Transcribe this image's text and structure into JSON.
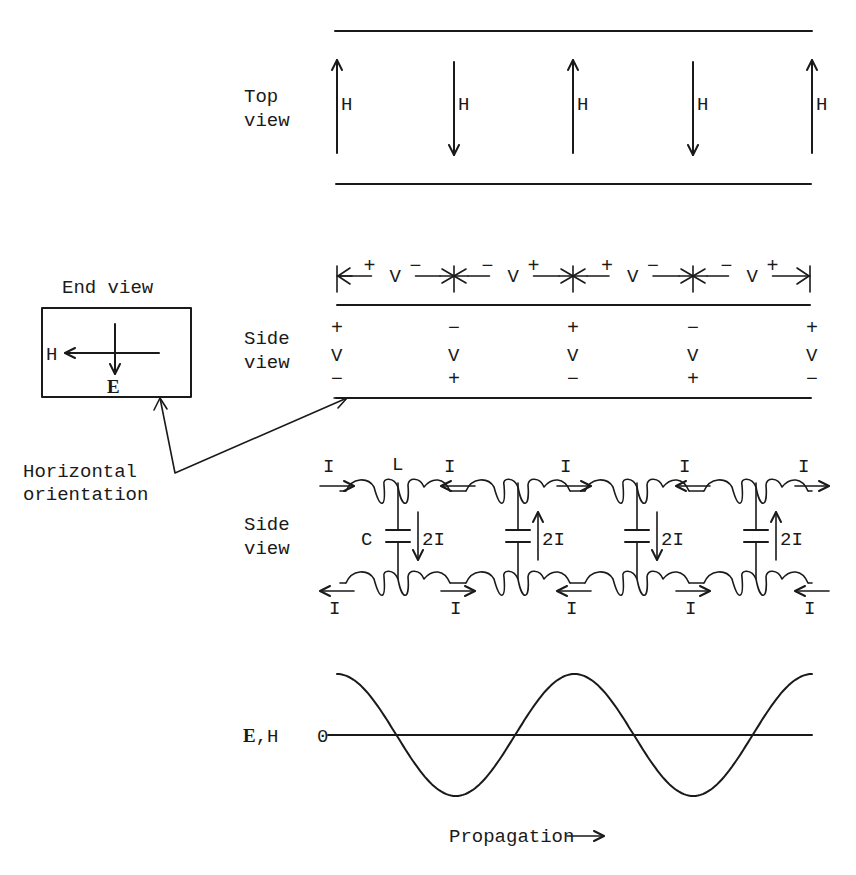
{
  "top_view": {
    "label_line1": "Top",
    "label_line2": "view",
    "field_label": "H",
    "arrows": [
      "up",
      "down",
      "up",
      "down",
      "up"
    ]
  },
  "end_view": {
    "title": "End view",
    "h_label": "H",
    "e_label": "E"
  },
  "side_view_voltage": {
    "label_line1": "Side",
    "label_line2": "view",
    "dimension_label": "V",
    "segments": [
      {
        "left": "+",
        "right": "−"
      },
      {
        "left": "−",
        "right": "+"
      },
      {
        "left": "+",
        "right": "−"
      },
      {
        "left": "−",
        "right": "+"
      }
    ],
    "columns": [
      {
        "top": "+",
        "mid": "V",
        "bottom": "−"
      },
      {
        "top": "−",
        "mid": "V",
        "bottom": "+"
      },
      {
        "top": "+",
        "mid": "V",
        "bottom": "−"
      },
      {
        "top": "−",
        "mid": "V",
        "bottom": "+"
      },
      {
        "top": "+",
        "mid": "V",
        "bottom": "−"
      }
    ]
  },
  "annotation": {
    "line1": "Horizontal",
    "line2": "orientation"
  },
  "side_view_circuit": {
    "label_line1": "Side",
    "label_line2": "view",
    "inductor_label": "L",
    "capacitor_label": "C",
    "current_label": "I",
    "shunt_current_label": "2I",
    "top_currents": [
      "right",
      "left",
      "right",
      "left",
      "right"
    ],
    "bottom_currents": [
      "left",
      "right",
      "left",
      "right",
      "left"
    ],
    "shunt_currents": [
      "down",
      "up",
      "down",
      "up"
    ]
  },
  "waveform": {
    "y_label_bold": "E",
    "y_label_rest": ",H",
    "zero_label": "0",
    "x_label": "Propagation"
  },
  "chart_data": {
    "type": "line",
    "title": "",
    "xlabel": "Propagation",
    "ylabel": "E,H",
    "series": [
      {
        "name": "E,H",
        "function": "cos",
        "cycles": 2,
        "amplitude": 1,
        "phase_start": "peak"
      }
    ],
    "x_range_cycles": [
      0,
      2
    ],
    "ylim": [
      -1,
      1
    ],
    "y_ticks": [
      "0"
    ]
  }
}
